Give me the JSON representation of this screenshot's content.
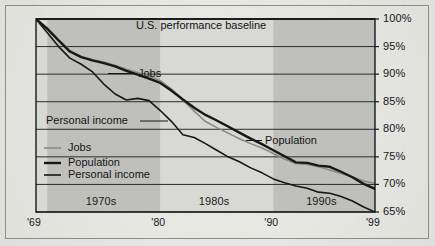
{
  "chart_data": {
    "type": "line",
    "title": "U.S. performance baseline",
    "xlabel": "",
    "ylabel": "",
    "grid": true,
    "legend_position": "lower-left-inside",
    "x": [
      1969,
      1970,
      1971,
      1972,
      1973,
      1974,
      1975,
      1976,
      1977,
      1978,
      1979,
      1980,
      1981,
      1982,
      1983,
      1984,
      1985,
      1986,
      1987,
      1988,
      1989,
      1990,
      1991,
      1992,
      1993,
      1994,
      1995,
      1996,
      1997,
      1998,
      1999
    ],
    "xlim": [
      1969,
      1999
    ],
    "ylim": [
      65,
      100
    ],
    "x_tick_labels": [
      "'69",
      "'80",
      "'90",
      "'99"
    ],
    "x_tick_values": [
      1969,
      1980,
      1990,
      1999
    ],
    "y_tick_labels": [
      "100%",
      "95%",
      "90%",
      "85%",
      "80%",
      "75%",
      "70%",
      "65%"
    ],
    "y_tick_values": [
      100,
      95,
      90,
      85,
      80,
      75,
      70,
      65
    ],
    "baseline_value": 100,
    "decade_bands": [
      {
        "label": "1970s",
        "start": 1970,
        "end": 1980,
        "shade": "dark"
      },
      {
        "label": "1980s",
        "start": 1980,
        "end": 1990,
        "shade": "light"
      },
      {
        "label": "1990s",
        "start": 1990,
        "end": 1999,
        "shade": "dark"
      }
    ],
    "series": [
      {
        "name": "Jobs",
        "color": "#8a8a87",
        "width": 1.6,
        "values": [
          100.0,
          98.4,
          96.3,
          94.3,
          93.2,
          92.6,
          92.2,
          91.6,
          90.9,
          90.3,
          89.6,
          88.8,
          87.3,
          85.3,
          83.3,
          81.4,
          80.3,
          79.3,
          78.3,
          77.4,
          76.6,
          75.6,
          74.6,
          73.8,
          73.6,
          73.2,
          72.6,
          72.0,
          71.4,
          70.6,
          70.2
        ]
      },
      {
        "name": "Population",
        "color": "#16171a",
        "width": 2.4,
        "values": [
          100.0,
          98.2,
          96.1,
          94.1,
          93.1,
          92.5,
          92.0,
          91.4,
          90.6,
          89.9,
          89.2,
          88.4,
          87.0,
          85.4,
          83.9,
          82.6,
          81.6,
          80.5,
          79.4,
          78.3,
          77.3,
          76.2,
          75.1,
          74.0,
          73.9,
          73.4,
          73.2,
          72.3,
          71.3,
          70.1,
          69.2
        ]
      },
      {
        "name": "Personal income",
        "color": "#16171a",
        "width": 1.6,
        "values": [
          100.0,
          97.5,
          95.0,
          92.9,
          91.8,
          90.4,
          88.2,
          86.4,
          85.3,
          85.6,
          85.2,
          83.4,
          81.4,
          79.0,
          78.5,
          77.4,
          76.2,
          75.0,
          74.1,
          73.0,
          72.1,
          71.0,
          70.3,
          69.7,
          69.3,
          68.6,
          68.4,
          67.8,
          67.0,
          65.9,
          65.0
        ]
      }
    ],
    "annotations": [
      {
        "text": "U.S. performance baseline",
        "at_x": 1980.2,
        "at_y": 100,
        "placement": "above-baseline"
      },
      {
        "text": "Jobs",
        "at_x": 1977.5,
        "at_y": 92.5,
        "placement": "right-of-leader"
      },
      {
        "text": "Personal income",
        "at_x": 1972.0,
        "at_y": 80.8,
        "placement": "left-of-leader"
      },
      {
        "text": "Population",
        "at_x": 1990.5,
        "at_y": 76.6,
        "placement": "right-of-leader"
      }
    ]
  },
  "legend": {
    "items": [
      {
        "label": "Jobs",
        "color": "#8a8a87",
        "width": 1.6
      },
      {
        "label": "Population",
        "color": "#16171a",
        "width": 2.4
      },
      {
        "label": "Personal income",
        "color": "#16171a",
        "width": 1.6
      }
    ]
  },
  "colors": {
    "paper": "#e8e8e4",
    "plot_light_band": "#d8d8d4",
    "plot_dark_band": "#bfbfbb",
    "axis": "#16171a",
    "gridline": "#2b2c2e",
    "text": "#141516"
  }
}
